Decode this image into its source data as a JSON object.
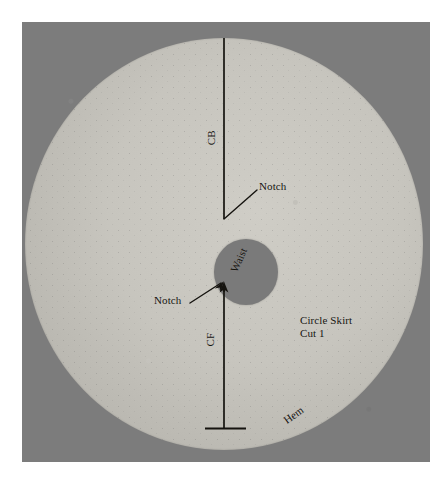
{
  "figure": {
    "type": "sewing-pattern-diagram",
    "background_color": "#7c7c7c",
    "fabric_color": "#c7c5be",
    "line_color": "#15130f"
  },
  "labels": {
    "center_back": "CB",
    "center_front": "CF",
    "notch_top": "Notch",
    "notch_bottom": "Notch",
    "waist": "Waist",
    "hem": "Hem",
    "piece_name": "Circle Skirt",
    "cut_instruction": "Cut 1"
  },
  "caption": {
    "text": ""
  },
  "geometry": {
    "disc_center_x": 224,
    "disc_center_y": 244,
    "disc_radius_x": 199,
    "disc_radius_y": 206,
    "waist_hole_center_x": 224,
    "waist_hole_center_y": 250,
    "waist_hole_radius": 33,
    "grainline_top_y": 38,
    "grainline_bottom_y": 428
  }
}
